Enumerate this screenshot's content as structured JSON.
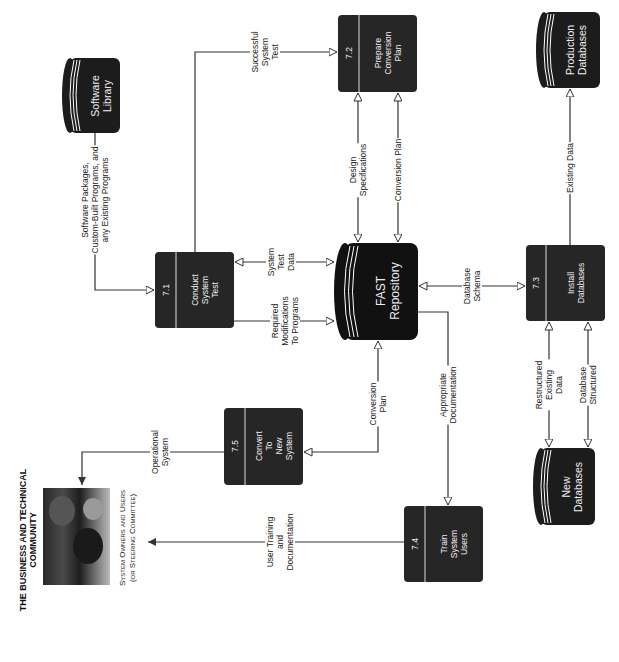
{
  "external_entity": {
    "title": "THE BUSINESS AND TECHNICAL\nCOMMUNITY",
    "subtitle": "System Owners and Users\n(or Steering Committee)",
    "image": "people-photo"
  },
  "processes": [
    {
      "id": "7.1",
      "label": "Conduct\nSystem\nTest"
    },
    {
      "id": "7.2",
      "label": "Prepare\nConversion\nPlan"
    },
    {
      "id": "7.3",
      "label": "Install\nDatabases"
    },
    {
      "id": "7.4",
      "label": "Train\nSystem\nUsers"
    },
    {
      "id": "7.5",
      "label": "Convert\nTo\nNew\nSystem"
    }
  ],
  "data_stores": [
    {
      "label": "Software\nLibrary"
    },
    {
      "label": "FAST\nRepository"
    },
    {
      "label": "Production\nDatabases"
    },
    {
      "label": "New\nDatabases"
    }
  ],
  "flows": [
    {
      "label": "Software Packages,\nCustom-Built Programs, and\nany Existing Programs",
      "from": "Software Library",
      "to": "7.1"
    },
    {
      "label": "Successful\nSystem\nTest",
      "from": "7.1",
      "to": "7.2"
    },
    {
      "label": "System\nTest\nData",
      "from": "FAST Repository",
      "to": "7.1",
      "bidirectional": true
    },
    {
      "label": "Required\nModifications\nTo Programs",
      "from": "7.1",
      "to": "FAST Repository"
    },
    {
      "label": "Design\nSpecifications",
      "from": "FAST Repository",
      "to": "7.2",
      "bidirectional": true
    },
    {
      "label": "Conversion Plan",
      "from": "7.2",
      "to": "FAST Repository",
      "bidirectional": true
    },
    {
      "label": "Database\nSchema",
      "from": "FAST Repository",
      "to": "7.3",
      "bidirectional": true
    },
    {
      "label": "Existing Data",
      "from": "7.3",
      "to": "Production Databases"
    },
    {
      "label": "Restructured\nExisting\nData",
      "from": "7.3",
      "to": "New Databases",
      "bidirectional": true
    },
    {
      "label": "Database\nStructured",
      "from": "7.3",
      "to": "New Databases",
      "bidirectional": true
    },
    {
      "label": "Conversion\nPlan",
      "from": "7.5",
      "to": "FAST Repository",
      "bidirectional": true
    },
    {
      "label": "Appropriate\nDocumentation",
      "from": "FAST Repository",
      "to": "7.4"
    },
    {
      "label": "Operational\nSystem",
      "from": "7.5",
      "to": "The Business and Technical Community"
    },
    {
      "label": "User Training\nand\nDocumentation",
      "from": "7.4",
      "to": "The Business and Technical Community"
    }
  ],
  "colors": {
    "shape_fill": "#1c1c1c",
    "line": "#333333",
    "text_on_dark": "#eeeeee"
  }
}
